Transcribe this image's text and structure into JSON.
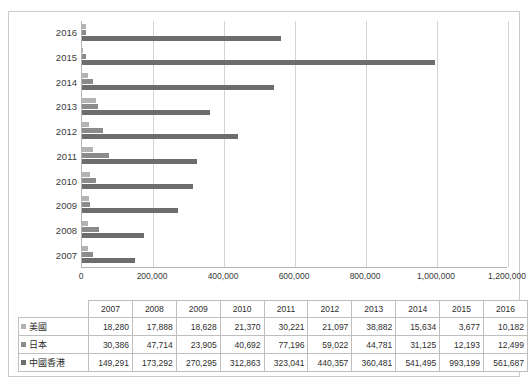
{
  "top_strip": {
    "left_ghost": "",
    "right_ghost": ""
  },
  "chart_data": {
    "type": "bar",
    "orientation": "horizontal",
    "title": "",
    "xlabel": "",
    "ylabel": "",
    "grid": true,
    "legend_position": "table-row-headers",
    "categories": [
      "2016",
      "2015",
      "2014",
      "2013",
      "2012",
      "2011",
      "2010",
      "2009",
      "2008",
      "2007"
    ],
    "table_categories": [
      "2007",
      "2008",
      "2009",
      "2010",
      "2011",
      "2012",
      "2013",
      "2014",
      "2015",
      "2016"
    ],
    "xlim": [
      0,
      1200000
    ],
    "xticks": [
      "0",
      "200,000",
      "400,000",
      "600,000",
      "800,000",
      "1,000,000",
      "1,200,000"
    ],
    "xtick_values": [
      0,
      200000,
      400000,
      600000,
      800000,
      1000000,
      1200000
    ],
    "series": [
      {
        "name": "美國",
        "color": "#b3b3b3",
        "values_by_table_year": [
          18280,
          17888,
          18628,
          21370,
          30221,
          21097,
          38882,
          15634,
          3677,
          10182
        ],
        "labels_by_table_year": [
          "18,280",
          "17,888",
          "18,628",
          "21,370",
          "30,221",
          "21,097",
          "38,882",
          "15,634",
          "3,677",
          "10,182"
        ]
      },
      {
        "name": "日本",
        "color": "#8b8b8b",
        "values_by_table_year": [
          30386,
          47714,
          23905,
          40692,
          77196,
          59022,
          44781,
          31125,
          12193,
          12499
        ],
        "labels_by_table_year": [
          "30,386",
          "47,714",
          "23,905",
          "40,692",
          "77,196",
          "59,022",
          "44,781",
          "31,125",
          "12,193",
          "12,499"
        ]
      },
      {
        "name": "中國香港",
        "color": "#6d6d6d",
        "values_by_table_year": [
          149291,
          173292,
          270295,
          312863,
          323041,
          440357,
          360481,
          541495,
          993199,
          561687
        ],
        "labels_by_table_year": [
          "149,291",
          "173,292",
          "270,295",
          "312,863",
          "323,041",
          "440,357",
          "360,481",
          "541,495",
          "993,199",
          "561,687"
        ]
      }
    ]
  }
}
